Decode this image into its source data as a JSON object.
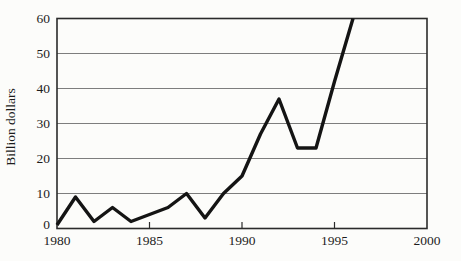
{
  "chart_data": {
    "type": "line",
    "title": "",
    "xlabel": "",
    "ylabel": "Billion dollars",
    "x": [
      1980,
      1981,
      1982,
      1983,
      1984,
      1985,
      1986,
      1987,
      1988,
      1989,
      1990,
      1991,
      1992,
      1993,
      1994,
      1995,
      1996
    ],
    "series": [
      {
        "name": "Billion dollars",
        "values": [
          1,
          9,
          2,
          6,
          2,
          4,
          6,
          10,
          3,
          10,
          15,
          27,
          37,
          23,
          23,
          42,
          60
        ]
      }
    ],
    "xlim": [
      1980,
      2000
    ],
    "ylim": [
      0,
      60
    ],
    "x_ticks": [
      1980,
      1985,
      1990,
      1995,
      2000
    ],
    "y_ticks": [
      0,
      10,
      20,
      30,
      40,
      50,
      60
    ],
    "grid": "horizontal gridlines at every y tick, full plot width",
    "legend": "none",
    "frame": "full box border around plot area",
    "colors": {
      "line": "#141414",
      "frame": "#2b2b2b",
      "grid": "#7d7d7d",
      "text": "#1c1c1c",
      "background": "#fcfcfa"
    }
  }
}
